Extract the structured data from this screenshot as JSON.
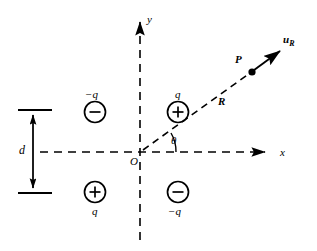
{
  "figure": {
    "background_color": "#ffffff",
    "stroke_color": "#000000",
    "width": 317,
    "height": 251
  },
  "axes": {
    "x_label": "x",
    "y_label": "y",
    "origin_label": "O",
    "origin_px": [
      140,
      152
    ],
    "style": "dashed",
    "x_arrow_tip_px": [
      272,
      152
    ],
    "y_arrow_tip_px": [
      140,
      14
    ]
  },
  "charges": [
    {
      "id": "charge-q2",
      "quadrant": "II",
      "sign_glyph": "−",
      "label": "−q",
      "label_position": "above",
      "center_px": [
        95,
        112
      ]
    },
    {
      "id": "charge-q1",
      "quadrant": "I",
      "sign_glyph": "+",
      "label": "q",
      "label_position": "above",
      "center_px": [
        178,
        112
      ]
    },
    {
      "id": "charge-q3",
      "quadrant": "III",
      "sign_glyph": "+",
      "label": "q",
      "label_position": "below",
      "center_px": [
        95,
        192
      ]
    },
    {
      "id": "charge-q4",
      "quadrant": "IV",
      "sign_glyph": "−",
      "label": "−q",
      "label_position": "below",
      "center_px": [
        178,
        192
      ]
    }
  ],
  "dimension": {
    "label": "d",
    "label_px": [
      22,
      146
    ],
    "top_tick_y": 110,
    "bottom_tick_y": 193,
    "tick_x_start": 18,
    "tick_x_end": 52,
    "arrow_x": 33
  },
  "ray": {
    "distance_label": "R",
    "distance_label_px": [
      219,
      100
    ],
    "point_label": "P",
    "point_label_px": [
      236,
      58
    ],
    "point_marker_px": [
      252,
      72
    ],
    "unit_vector_label": "u",
    "unit_vector_subscript": "R",
    "unit_vector_label_px": [
      286,
      40
    ],
    "dashed_from_px": [
      140,
      152
    ],
    "dashed_to_px": [
      252,
      72
    ],
    "arrow_tip_px": [
      284,
      49
    ]
  },
  "angle": {
    "symbol": "θ",
    "label_px": [
      172,
      139
    ],
    "value_deg": 28,
    "arc_radius_px": 34
  }
}
